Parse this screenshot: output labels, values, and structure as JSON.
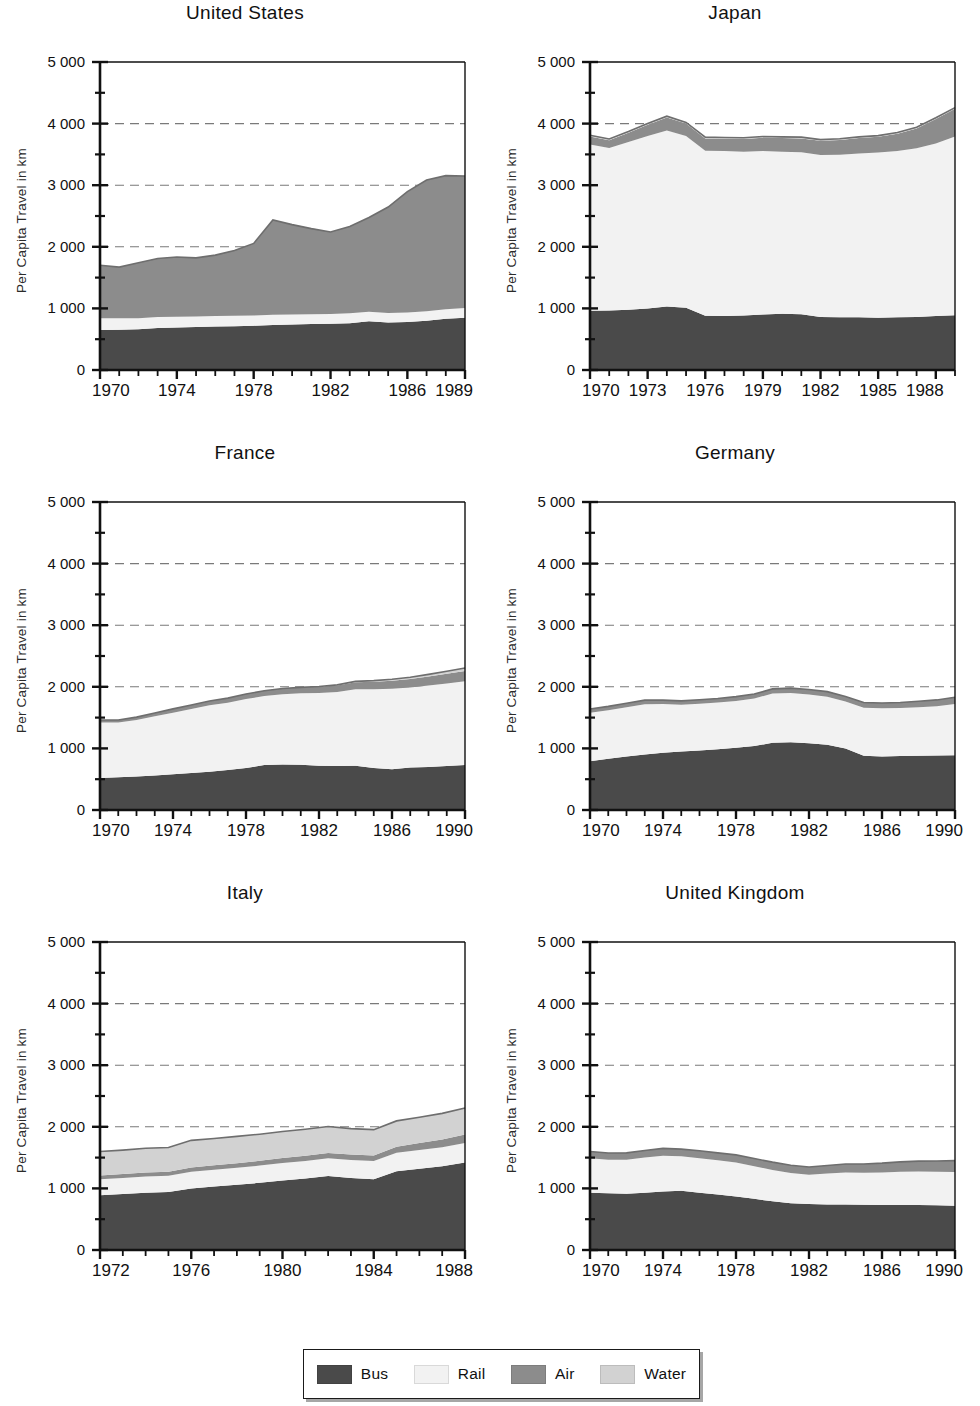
{
  "figure": {
    "ylabel": "Per Capita Travel in km",
    "y_ticks": [
      "0",
      "1 000",
      "2 000",
      "3 000",
      "4 000",
      "5 000"
    ],
    "y_tick_values": [
      0,
      1000,
      2000,
      3000,
      4000,
      5000
    ],
    "y_minor_values": [
      500,
      1500,
      2500,
      3500,
      4500
    ],
    "gridlines_at": [
      2000,
      3000,
      4000
    ],
    "ylim": [
      0,
      5000
    ]
  },
  "legend": {
    "items": [
      {
        "label": "Bus",
        "color": "#4a4a4a"
      },
      {
        "label": "Rail",
        "color": "#f2f2f2"
      },
      {
        "label": "Air",
        "color": "#8c8c8c"
      },
      {
        "label": "Water",
        "color": "#d2d2d2"
      }
    ]
  },
  "colors": {
    "bus": "#4a4a4a",
    "rail": "#f2f2f2",
    "air": "#8c8c8c",
    "water": "#d2d2d2",
    "axis": "#111111",
    "grid": "#7a7a7a"
  },
  "chart_data": [
    {
      "type": "area",
      "title": "United States",
      "xlabel": "",
      "ylabel": "Per Capita Travel in km",
      "ylim": [
        0,
        5000
      ],
      "xlim": [
        1970,
        1989
      ],
      "grid": true,
      "legend_position": "bottom",
      "x": [
        1970,
        1971,
        1972,
        1973,
        1974,
        1975,
        1976,
        1977,
        1978,
        1979,
        1980,
        1981,
        1982,
        1983,
        1984,
        1985,
        1986,
        1987,
        1988,
        1989
      ],
      "x_ticks": [
        "1970",
        "1974",
        "1978",
        "1982",
        "1986",
        "1989"
      ],
      "x_tick_values": [
        1970,
        1974,
        1978,
        1982,
        1986,
        1989
      ],
      "series": [
        {
          "name": "Bus",
          "values": [
            650,
            655,
            660,
            680,
            690,
            700,
            705,
            710,
            720,
            730,
            740,
            745,
            750,
            760,
            790,
            770,
            780,
            800,
            830,
            850
          ]
        },
        {
          "name": "Rail",
          "values": [
            190,
            185,
            180,
            180,
            175,
            170,
            170,
            170,
            165,
            165,
            160,
            160,
            160,
            160,
            155,
            155,
            155,
            155,
            155,
            155
          ]
        },
        {
          "name": "Air",
          "values": [
            860,
            830,
            900,
            950,
            970,
            950,
            990,
            1060,
            1170,
            1540,
            1460,
            1390,
            1330,
            1410,
            1530,
            1720,
            1960,
            2130,
            2170,
            2145
          ]
        },
        {
          "name": "Water",
          "values": [
            0,
            0,
            0,
            0,
            0,
            0,
            0,
            0,
            0,
            0,
            0,
            0,
            0,
            0,
            0,
            0,
            0,
            0,
            0,
            0
          ]
        }
      ],
      "totals": [
        1700,
        1670,
        1740,
        1810,
        1835,
        1820,
        1865,
        1940,
        2055,
        2435,
        2360,
        2295,
        2240,
        2330,
        2475,
        2645,
        2895,
        3085,
        3155,
        3150
      ]
    },
    {
      "type": "area",
      "title": "Japan",
      "xlabel": "",
      "ylabel": "Per Capita Travel in km",
      "ylim": [
        0,
        5000
      ],
      "xlim": [
        1970,
        1989
      ],
      "grid": true,
      "legend_position": "bottom",
      "x": [
        1970,
        1971,
        1972,
        1973,
        1974,
        1975,
        1976,
        1977,
        1978,
        1979,
        1980,
        1981,
        1982,
        1983,
        1984,
        1985,
        1986,
        1987,
        1988,
        1989
      ],
      "x_ticks": [
        "1970",
        "1973",
        "1976",
        "1979",
        "1982",
        "1985",
        "1988"
      ],
      "x_tick_values": [
        1970,
        1973,
        1976,
        1979,
        1982,
        1985,
        1988
      ],
      "series": [
        {
          "name": "Bus",
          "values": [
            960,
            965,
            980,
            1000,
            1030,
            1010,
            880,
            875,
            885,
            900,
            915,
            905,
            860,
            855,
            855,
            850,
            855,
            860,
            875,
            890
          ]
        },
        {
          "name": "Rail",
          "values": [
            2700,
            2640,
            2720,
            2800,
            2860,
            2790,
            2680,
            2680,
            2660,
            2655,
            2630,
            2630,
            2630,
            2640,
            2660,
            2680,
            2700,
            2740,
            2800,
            2900
          ]
        },
        {
          "name": "Air",
          "values": [
            130,
            125,
            150,
            180,
            210,
            200,
            200,
            200,
            205,
            215,
            220,
            225,
            230,
            240,
            250,
            255,
            280,
            320,
            400,
            450
          ]
        },
        {
          "name": "Water",
          "values": [
            20,
            20,
            20,
            20,
            20,
            20,
            20,
            20,
            20,
            20,
            20,
            20,
            20,
            20,
            20,
            20,
            20,
            20,
            20,
            20
          ]
        }
      ],
      "totals": [
        3810,
        3750,
        3870,
        4000,
        4120,
        4020,
        3780,
        3775,
        3770,
        3790,
        3785,
        3780,
        3740,
        3755,
        3785,
        3805,
        3855,
        3940,
        4095,
        4260
      ]
    },
    {
      "type": "area",
      "title": "France",
      "xlabel": "",
      "ylabel": "Per Capita Travel in km",
      "ylim": [
        0,
        5000
      ],
      "xlim": [
        1970,
        1990
      ],
      "grid": true,
      "legend_position": "bottom",
      "x": [
        1970,
        1971,
        1972,
        1973,
        1974,
        1975,
        1976,
        1977,
        1978,
        1979,
        1980,
        1981,
        1982,
        1983,
        1984,
        1985,
        1986,
        1987,
        1988,
        1989,
        1990
      ],
      "x_ticks": [
        "1970",
        "1974",
        "1978",
        "1982",
        "1986",
        "1990"
      ],
      "x_tick_values": [
        1970,
        1974,
        1978,
        1982,
        1986,
        1990
      ],
      "series": [
        {
          "name": "Bus",
          "values": [
            520,
            530,
            545,
            560,
            580,
            600,
            620,
            650,
            680,
            730,
            740,
            735,
            720,
            715,
            720,
            680,
            660,
            690,
            700,
            715,
            730
          ]
        },
        {
          "name": "Rail",
          "values": [
            900,
            890,
            915,
            960,
            1000,
            1040,
            1080,
            1090,
            1120,
            1120,
            1140,
            1160,
            1180,
            1200,
            1240,
            1280,
            1310,
            1300,
            1320,
            1340,
            1360
          ]
        },
        {
          "name": "Air",
          "values": [
            40,
            42,
            48,
            55,
            62,
            66,
            70,
            76,
            82,
            86,
            92,
            96,
            100,
            106,
            114,
            122,
            128,
            136,
            146,
            156,
            166
          ]
        },
        {
          "name": "Water",
          "values": [
            0,
            0,
            0,
            0,
            0,
            0,
            0,
            0,
            0,
            0,
            0,
            0,
            6,
            10,
            14,
            18,
            24,
            30,
            36,
            42,
            48
          ]
        }
      ],
      "totals": [
        1460,
        1462,
        1508,
        1575,
        1642,
        1706,
        1770,
        1816,
        1882,
        1936,
        1972,
        1991,
        2006,
        2031,
        2088,
        2100,
        2122,
        2156,
        2202,
        2253,
        2304
      ]
    },
    {
      "type": "area",
      "title": "Germany",
      "xlabel": "",
      "ylabel": "Per Capita Travel in km",
      "ylim": [
        0,
        5000
      ],
      "xlim": [
        1970,
        1990
      ],
      "grid": true,
      "legend_position": "bottom",
      "x": [
        1970,
        1971,
        1972,
        1973,
        1974,
        1975,
        1976,
        1977,
        1978,
        1979,
        1980,
        1981,
        1982,
        1983,
        1984,
        1985,
        1986,
        1987,
        1988,
        1989,
        1990
      ],
      "x_ticks": [
        "1970",
        "1974",
        "1978",
        "1982",
        "1986",
        "1990"
      ],
      "x_tick_values": [
        1970,
        1974,
        1978,
        1982,
        1986,
        1990
      ],
      "series": [
        {
          "name": "Bus",
          "values": [
            790,
            830,
            870,
            900,
            930,
            950,
            965,
            985,
            1010,
            1040,
            1090,
            1100,
            1085,
            1060,
            1000,
            880,
            870,
            875,
            880,
            885,
            890
          ]
        },
        {
          "name": "Rail",
          "values": [
            790,
            790,
            800,
            815,
            790,
            760,
            760,
            760,
            760,
            770,
            800,
            800,
            790,
            780,
            760,
            780,
            780,
            780,
            790,
            800,
            830
          ]
        },
        {
          "name": "Air",
          "values": [
            60,
            62,
            64,
            68,
            64,
            62,
            64,
            66,
            70,
            72,
            76,
            78,
            80,
            82,
            84,
            84,
            86,
            90,
            96,
            102,
            110
          ]
        },
        {
          "name": "Water",
          "values": [
            0,
            0,
            0,
            0,
            0,
            0,
            0,
            0,
            0,
            0,
            0,
            0,
            0,
            0,
            0,
            0,
            0,
            0,
            0,
            0,
            0
          ]
        }
      ],
      "totals": [
        1640,
        1682,
        1734,
        1783,
        1784,
        1772,
        1789,
        1811,
        1840,
        1882,
        1966,
        1978,
        1955,
        1922,
        1844,
        1744,
        1736,
        1745,
        1766,
        1787,
        1830
      ]
    },
    {
      "type": "area",
      "title": "Italy",
      "xlabel": "",
      "ylabel": "Per Capita Travel in km",
      "ylim": [
        0,
        5000
      ],
      "xlim": [
        1972,
        1988
      ],
      "grid": true,
      "legend_position": "bottom",
      "x": [
        1972,
        1973,
        1974,
        1975,
        1976,
        1977,
        1978,
        1979,
        1980,
        1981,
        1982,
        1983,
        1984,
        1985,
        1986,
        1987,
        1988
      ],
      "x_ticks": [
        "1972",
        "1976",
        "1980",
        "1984",
        "1988"
      ],
      "x_tick_values": [
        1972,
        1976,
        1980,
        1984,
        1988
      ],
      "series": [
        {
          "name": "Bus",
          "values": [
            890,
            910,
            930,
            940,
            1000,
            1030,
            1060,
            1090,
            1130,
            1160,
            1200,
            1170,
            1150,
            1280,
            1320,
            1360,
            1420
          ]
        },
        {
          "name": "Rail",
          "values": [
            260,
            260,
            265,
            265,
            270,
            272,
            276,
            280,
            282,
            286,
            290,
            292,
            296,
            300,
            305,
            310,
            315
          ]
        },
        {
          "name": "Air",
          "values": [
            60,
            62,
            64,
            66,
            70,
            72,
            74,
            78,
            80,
            84,
            86,
            88,
            90,
            98,
            110,
            124,
            140
          ]
        },
        {
          "name": "Water",
          "values": [
            390,
            390,
            392,
            394,
            440,
            436,
            434,
            432,
            432,
            430,
            428,
            420,
            418,
            418,
            420,
            424,
            430
          ]
        }
      ],
      "totals": [
        1600,
        1622,
        1651,
        1665,
        1780,
        1810,
        1844,
        1880,
        1924,
        1960,
        2004,
        1970,
        1954,
        2096,
        2155,
        2218,
        2305
      ]
    },
    {
      "type": "area",
      "title": "United Kingdom",
      "xlabel": "",
      "ylabel": "Per Capita Travel in km",
      "ylim": [
        0,
        5000
      ],
      "xlim": [
        1970,
        1990
      ],
      "grid": true,
      "legend_position": "bottom",
      "x": [
        1970,
        1971,
        1972,
        1973,
        1974,
        1975,
        1976,
        1977,
        1978,
        1979,
        1980,
        1981,
        1982,
        1983,
        1984,
        1985,
        1986,
        1987,
        1988,
        1989,
        1990
      ],
      "x_ticks": [
        "1970",
        "1974",
        "1978",
        "1982",
        "1986",
        "1990"
      ],
      "x_tick_values": [
        1970,
        1974,
        1978,
        1982,
        1986,
        1990
      ],
      "series": [
        {
          "name": "Bus",
          "values": [
            930,
            920,
            915,
            930,
            950,
            960,
            930,
            900,
            870,
            830,
            790,
            760,
            745,
            740,
            740,
            735,
            730,
            730,
            730,
            725,
            720
          ]
        },
        {
          "name": "Rail",
          "values": [
            560,
            545,
            550,
            570,
            580,
            560,
            560,
            555,
            550,
            530,
            510,
            490,
            475,
            500,
            520,
            520,
            530,
            540,
            545,
            545,
            545
          ]
        },
        {
          "name": "Air",
          "values": [
            110,
            110,
            112,
            116,
            120,
            118,
            120,
            122,
            124,
            124,
            126,
            126,
            128,
            132,
            136,
            142,
            150,
            160,
            168,
            176,
            186
          ]
        },
        {
          "name": "Water",
          "values": [
            0,
            0,
            0,
            0,
            0,
            0,
            0,
            0,
            0,
            0,
            0,
            0,
            0,
            0,
            0,
            0,
            0,
            0,
            0,
            0,
            0
          ]
        }
      ],
      "totals": [
        1600,
        1575,
        1577,
        1616,
        1650,
        1638,
        1610,
        1577,
        1544,
        1484,
        1426,
        1376,
        1348,
        1372,
        1396,
        1397,
        1410,
        1430,
        1443,
        1446,
        1451
      ]
    }
  ]
}
